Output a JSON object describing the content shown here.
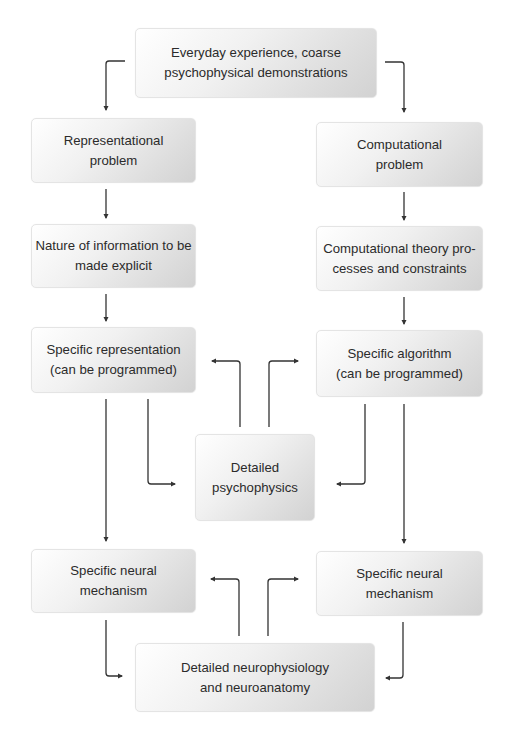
{
  "diagram": {
    "nodes": {
      "top": {
        "label": "Everyday experience, coarse\npsychophysical demonstrations"
      },
      "rep_problem": {
        "label": "Representational\nproblem"
      },
      "comp_problem": {
        "label": "Computational\nproblem"
      },
      "nature_info": {
        "label": "Nature of information to be\nmade explicit"
      },
      "comp_theory": {
        "label": "Computational theory pro-\ncesses and constraints"
      },
      "specific_rep": {
        "label": "Specific representation\n(can be programmed)"
      },
      "specific_alg": {
        "label": "Specific algorithm\n(can be programmed)"
      },
      "psychophysics": {
        "label": "Detailed\npsychophysics"
      },
      "neural_left": {
        "label": "Specific neural\nmechanism"
      },
      "neural_right": {
        "label": "Specific neural\nmechanism"
      },
      "neurophysiology": {
        "label": "Detailed neurophysiology\nand neuroanatomy"
      }
    },
    "edges": [
      {
        "from": "top",
        "to": "rep_problem"
      },
      {
        "from": "top",
        "to": "comp_problem"
      },
      {
        "from": "rep_problem",
        "to": "nature_info"
      },
      {
        "from": "comp_problem",
        "to": "comp_theory"
      },
      {
        "from": "nature_info",
        "to": "specific_rep"
      },
      {
        "from": "comp_theory",
        "to": "specific_alg"
      },
      {
        "from": "specific_rep",
        "to": "psychophysics"
      },
      {
        "from": "specific_alg",
        "to": "psychophysics"
      },
      {
        "from": "psychophysics",
        "to": "specific_rep"
      },
      {
        "from": "psychophysics",
        "to": "specific_alg"
      },
      {
        "from": "specific_rep",
        "to": "neural_left"
      },
      {
        "from": "specific_alg",
        "to": "neural_right"
      },
      {
        "from": "neural_left",
        "to": "neurophysiology"
      },
      {
        "from": "neural_right",
        "to": "neurophysiology"
      },
      {
        "from": "neurophysiology",
        "to": "neural_left"
      },
      {
        "from": "neurophysiology",
        "to": "neural_right"
      }
    ],
    "colors": {
      "arrow": "#333333",
      "box_light": "#ffffff",
      "box_dark": "#d2d2d2"
    }
  }
}
